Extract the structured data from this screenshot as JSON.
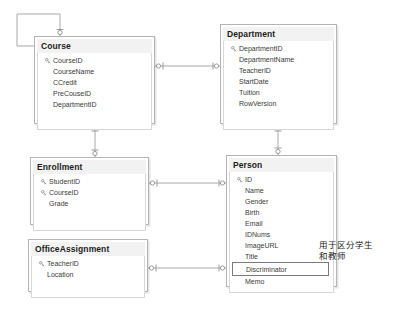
{
  "diagram": {
    "type": "entity-relationship-diagram",
    "background": "#ffffff",
    "box_border_color": "#b4b4b4",
    "header_fill": "#f2f2f2",
    "connector_color": "#a8a8a8",
    "highlight_border_color": "#7a7a7a"
  },
  "entities": [
    {
      "name": "Course",
      "title": "Course",
      "x": 34,
      "y": 36,
      "width": 121,
      "height": 88,
      "fields": [
        {
          "label": "CourseID",
          "key": true
        },
        {
          "label": "CourseName",
          "key": false
        },
        {
          "label": "CCredit",
          "key": false
        },
        {
          "label": "PreCouseID",
          "key": false
        },
        {
          "label": "DepartmentID",
          "key": false
        }
      ]
    },
    {
      "name": "Department",
      "title": "Department",
      "x": 220,
      "y": 24,
      "width": 117,
      "height": 100,
      "fields": [
        {
          "label": "DepartmentID",
          "key": true
        },
        {
          "label": "DepartmentName",
          "key": false
        },
        {
          "label": "TeacherID",
          "key": false
        },
        {
          "label": "StartDate",
          "key": false
        },
        {
          "label": "Tuition",
          "key": false
        },
        {
          "label": "RowVersion",
          "key": false
        }
      ]
    },
    {
      "name": "Enrollment",
      "title": "Enrollment",
      "x": 30,
      "y": 157,
      "width": 119,
      "height": 68,
      "fields": [
        {
          "label": "StudentID",
          "key": true
        },
        {
          "label": "CourseID",
          "key": true
        },
        {
          "label": "Grade",
          "key": false
        }
      ]
    },
    {
      "name": "Person",
      "title": "Person",
      "x": 226,
      "y": 155,
      "width": 111,
      "height": 132,
      "fields": [
        {
          "label": "ID",
          "key": true,
          "highlight": false
        },
        {
          "label": "Name",
          "key": false,
          "highlight": false
        },
        {
          "label": "Gender",
          "key": false,
          "highlight": false
        },
        {
          "label": "Birth",
          "key": false,
          "highlight": false
        },
        {
          "label": "Email",
          "key": false,
          "highlight": false
        },
        {
          "label": "IDNums",
          "key": false,
          "highlight": false
        },
        {
          "label": "ImageURL",
          "key": false,
          "highlight": false
        },
        {
          "label": "Title",
          "key": false,
          "highlight": false
        },
        {
          "label": "Discriminator",
          "key": false,
          "highlight": true
        },
        {
          "label": "Memo",
          "key": false,
          "highlight": false
        }
      ]
    },
    {
      "name": "OfficeAssignment",
      "title": "OfficeAssignment",
      "x": 28,
      "y": 239,
      "width": 120,
      "height": 53,
      "fields": [
        {
          "label": "TeacherID",
          "key": true
        },
        {
          "label": "Location",
          "key": false
        }
      ]
    }
  ],
  "annotations": [
    {
      "name": "discriminator-note",
      "text": "用于区分学生\n和教师",
      "x": 319,
      "y": 240
    }
  ]
}
